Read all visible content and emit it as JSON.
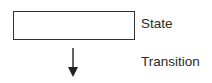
{
  "legend": {
    "items": [
      {
        "symbol": "rectangle",
        "label": "State"
      },
      {
        "symbol": "down-arrow",
        "label": "Transition"
      }
    ],
    "colors": {
      "stroke": "#333333",
      "text": "#2a2a2a",
      "background": "#ffffff"
    }
  }
}
